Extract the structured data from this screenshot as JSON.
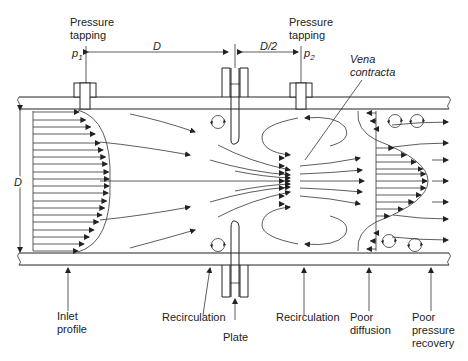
{
  "diagram": {
    "labels": {
      "pressure_tapping_1": [
        "Pressure",
        "tapping"
      ],
      "pressure_tapping_2": [
        "Pressure",
        "tapping"
      ],
      "p1": "p",
      "p1_sub": "1",
      "p2": "p",
      "p2_sub": "2",
      "dim_D_top": "D",
      "dim_D2": "D/2",
      "dim_D_side": "D",
      "vena_contracta": [
        "Vena",
        "contracta"
      ],
      "inlet_profile": [
        "Inlet",
        "profile"
      ],
      "recirculation_1": "Recirculation",
      "plate": "Plate",
      "recirculation_2": "Recirculation",
      "poor_diffusion": [
        "Poor",
        "diffusion"
      ],
      "poor_pressure_recovery": [
        "Poor",
        "pressure",
        "recovery"
      ]
    }
  }
}
